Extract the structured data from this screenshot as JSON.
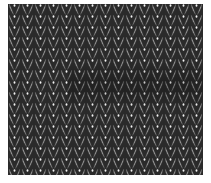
{
  "image": {
    "subject": "Knitted fabric, stockinette stitch",
    "caption": "Knitted fabric texture",
    "colors": {
      "background": "#ffffff",
      "stitch_light": "#d9d9d9",
      "stitch_mid": "#b4b4b4",
      "stitch_outline": "#2a2a2a",
      "shadow_band": "#5a5a5a"
    },
    "fabric": {
      "left": 8,
      "top": 4,
      "width": 195,
      "height": 171,
      "stitch_width": 13,
      "row_height": 11
    }
  }
}
